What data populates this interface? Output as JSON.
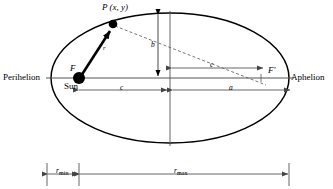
{
  "figure": {
    "background_color": "#ffffff",
    "stroke_color": "#000000",
    "dim_line_color": "#555555",
    "width": 333,
    "height": 189
  },
  "labels": {
    "perihelion": "Perihelion",
    "aphelion": "Aphelion",
    "point_p": "P (x, y)",
    "focus_f": "F",
    "focus_f_prime": "F",
    "focus_f_prime_mark": "'",
    "sun": "Sun",
    "radius_r": "r",
    "semi_minor_b": "b",
    "semi_major_a": "a",
    "focal_c_lower": "c",
    "focal_c_upper": "c",
    "r_min_base": "r",
    "r_min_sub": "min",
    "r_max_base": "r",
    "r_max_sub": "max"
  },
  "geometry": {
    "ellipse_center_x": 170,
    "ellipse_center_y": 78,
    "semi_major_axis_px": 119,
    "semi_minor_axis_px": 65,
    "focus_left_x": 79,
    "focus_right_x": 261,
    "point_p_x": 113,
    "point_p_y": 24,
    "major_axis_y": 78,
    "baseline_y": 174
  }
}
